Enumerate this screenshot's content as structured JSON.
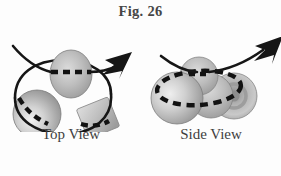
{
  "figure": {
    "title": "Fig. 26",
    "panels": [
      {
        "id": "top-view",
        "caption": "Top View",
        "description": "Three spherical/cubic bodies arranged in a triangle with a solid rotation loop passing in front of and behind them, terminating in a solid arrowhead pointing up-right",
        "elements": [
          {
            "name": "sphere-upper",
            "shape": "sphere",
            "dash_overlay": true
          },
          {
            "name": "sphere-lower-left",
            "shape": "sphere",
            "dash_overlay": true
          },
          {
            "name": "cube-lower-right",
            "shape": "cube",
            "dash_overlay": true
          },
          {
            "name": "rotation-loop",
            "shape": "ellipse-path",
            "dash_overlay": true
          },
          {
            "name": "rotation-arrow",
            "shape": "arrow",
            "direction": "up-right"
          }
        ]
      },
      {
        "id": "side-view",
        "caption": "Side View",
        "description": "Cluster of spheres seen edge-on with a dashed elliptical rotation path encircling them and an arrow sweeping over the top to the upper right",
        "elements": [
          {
            "name": "sphere-front-left",
            "shape": "sphere",
            "dash_overlay": true
          },
          {
            "name": "sphere-back-top",
            "shape": "sphere",
            "dash_overlay": true
          },
          {
            "name": "sphere-right",
            "shape": "sphere",
            "dash_overlay": true
          },
          {
            "name": "torus-far-right",
            "shape": "torus",
            "dash_overlay": true
          },
          {
            "name": "rotation-loop",
            "shape": "ellipse-dashed",
            "dash_overlay": true
          },
          {
            "name": "rotation-arrow",
            "shape": "arrow",
            "direction": "up-right"
          }
        ]
      }
    ]
  },
  "colors": {
    "background": "#fdfdfd",
    "title_text": "#464646",
    "caption_text": "#3f3f3f",
    "stroke": "#161616",
    "sphere_light": "#e6e6e6",
    "sphere_mid": "#b8b8b8",
    "sphere_dark": "#8e8e8e",
    "sphere_edge": "#777777"
  }
}
